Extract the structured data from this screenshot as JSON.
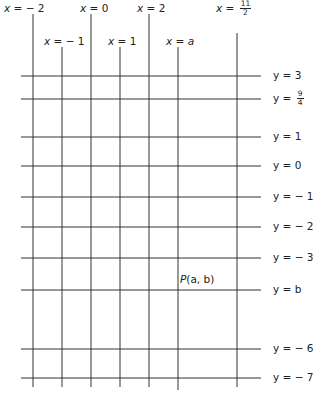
{
  "diagram": {
    "type": "coordinate-grid",
    "line_color": "#333333",
    "vertical_lines": [
      {
        "label_var": "x",
        "label_eq": "=",
        "label_val": "− 2",
        "x": 33,
        "top": 14,
        "bottom": 387,
        "label_x": 4,
        "label_y": 2
      },
      {
        "label_var": "x",
        "label_eq": "=",
        "label_val": "− 1",
        "x": 62,
        "top": 47,
        "bottom": 387,
        "label_x": 44,
        "label_y": 35
      },
      {
        "label_var": "x",
        "label_eq": "=",
        "label_val": "0",
        "x": 91,
        "top": 14,
        "bottom": 387,
        "label_x": 80,
        "label_y": 2
      },
      {
        "label_var": "x",
        "label_eq": "=",
        "label_val": "1",
        "x": 120,
        "top": 47,
        "bottom": 387,
        "label_x": 108,
        "label_y": 35
      },
      {
        "label_var": "x",
        "label_eq": "=",
        "label_val": "2",
        "x": 149,
        "top": 14,
        "bottom": 387,
        "label_x": 137,
        "label_y": 2
      },
      {
        "label_var": "x",
        "label_eq": "=",
        "label_val": "a",
        "x": 178,
        "top": 47,
        "bottom": 390,
        "label_x": 166,
        "label_y": 35
      },
      {
        "label_var": "x",
        "label_eq": "=",
        "label_frac_num": "11",
        "label_frac_den": "2",
        "x": 237,
        "top": 33,
        "bottom": 387,
        "label_x": 216,
        "label_y": 0
      }
    ],
    "horizontal_lines": [
      {
        "label_var": "y",
        "label_eq": "=",
        "label_val": "3",
        "y": 76,
        "left": 21,
        "right": 261
      },
      {
        "label_var": "y",
        "label_eq": "=",
        "label_frac_num": "9",
        "label_frac_den": "4",
        "y": 99,
        "left": 21,
        "right": 261
      },
      {
        "label_var": "y",
        "label_eq": "=",
        "label_val": "1",
        "y": 137,
        "left": 21,
        "right": 261
      },
      {
        "label_var": "y",
        "label_eq": "=",
        "label_val": "0",
        "y": 166,
        "left": 21,
        "right": 261
      },
      {
        "label_var": "y",
        "label_eq": "=",
        "label_val": "− 1",
        "y": 197,
        "left": 21,
        "right": 261
      },
      {
        "label_var": "y",
        "label_eq": "=",
        "label_val": "− 2",
        "y": 227,
        "left": 21,
        "right": 261
      },
      {
        "label_var": "y",
        "label_eq": "=",
        "label_val": "− 3",
        "y": 258,
        "left": 21,
        "right": 261
      },
      {
        "label_var": "y",
        "label_eq": "=",
        "label_val": "b",
        "y": 290,
        "left": 21,
        "right": 261
      },
      {
        "label_var": "y",
        "label_eq": "=",
        "label_val": "− 6",
        "y": 349,
        "left": 21,
        "right": 261
      },
      {
        "label_var": "y",
        "label_eq": "=",
        "label_val": "− 7",
        "y": 378,
        "left": 21,
        "right": 261
      }
    ],
    "point": {
      "name": "P",
      "coords": "(a, b)",
      "x": 178,
      "y": 290,
      "label_x": 180,
      "label_y": 273
    }
  }
}
